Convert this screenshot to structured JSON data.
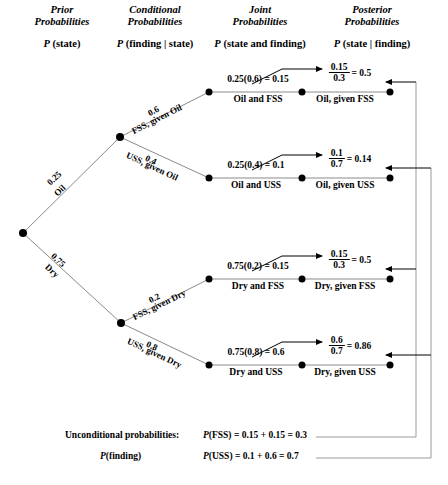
{
  "headers": [
    {
      "line1": "Prior",
      "line2": "Probabilities",
      "x": 62,
      "y": 4
    },
    {
      "line1": "Conditional",
      "line2": "Probabilities",
      "x": 155,
      "y": 4
    },
    {
      "line1": "Joint",
      "line2": "Probabilities",
      "x": 260,
      "y": 4
    },
    {
      "line1": "Posterior",
      "line2": "Probabilities",
      "x": 372,
      "y": 4
    }
  ],
  "subheaders": [
    {
      "p": "P",
      "rest": " (state)",
      "x": 62,
      "y": 38
    },
    {
      "p": "P",
      "rest": " (finding | state)",
      "x": 155,
      "y": 38
    },
    {
      "p": "P",
      "rest": " (state and finding)",
      "x": 260,
      "y": 38
    },
    {
      "p": "P",
      "rest": " (state | finding)",
      "x": 372,
      "y": 38
    }
  ],
  "prior_branches": [
    {
      "prob": "0.25",
      "state": "Oil"
    },
    {
      "prob": "0.75",
      "state": "Dry"
    }
  ],
  "conditional_branches": [
    {
      "prob": "0.6",
      "label": "FSS, given Oil"
    },
    {
      "prob": "0.4",
      "label": "USS, given Oil"
    },
    {
      "prob": "0.2",
      "label": "FSS, given Dry"
    },
    {
      "prob": "0.8",
      "label": "USS, given Dry"
    }
  ],
  "rows": [
    {
      "joint_value": "0.25(0.6) = 0.15",
      "joint_name": "Oil and FSS",
      "post_num": "0.15",
      "post_den": "0.3",
      "post_eq": "= 0.5",
      "post_name": "Oil, given FSS",
      "y": 92
    },
    {
      "joint_value": "0.25(0.4) = 0.1",
      "joint_name": "Oil and USS",
      "post_num": "0.1",
      "post_den": "0.7",
      "post_eq": "= 0.14",
      "post_name": "Oil, given USS",
      "y": 178
    },
    {
      "joint_value": "0.75(0.2) = 0.15",
      "joint_name": "Dry and FSS",
      "post_num": "0.15",
      "post_den": "0.3",
      "post_eq": "= 0.5",
      "post_name": "Dry, given FSS",
      "y": 279
    },
    {
      "joint_value": "0.75(0.8) = 0.6",
      "joint_name": "Dry and USS",
      "post_num": "0.6",
      "post_den": "0.7",
      "post_eq": "= 0.86",
      "post_name": "Dry, given USS",
      "y": 365
    }
  ],
  "summary": {
    "label_line1": "Unconditional probabilities:",
    "label_line2_p": "P",
    "label_line2_rest": "(finding)",
    "eq_line1_p": "P",
    "eq_line1_rest": "(FSS) = 0.15 + 0.15 = 0.3",
    "eq_line2_p": "P",
    "eq_line2_rest": "(USS) = 0.1 + 0.6 = 0.7"
  },
  "colors": {
    "line": "#8a8a8a",
    "rail": "#9a9a9a",
    "arrow": "#000000",
    "node": "#000000"
  }
}
